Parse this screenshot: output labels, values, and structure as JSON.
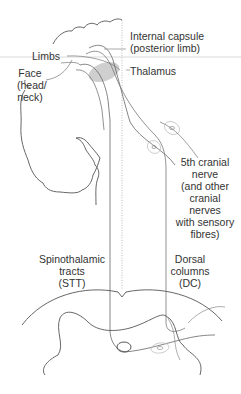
{
  "labels": {
    "internal_capsule": {
      "line1": "Internal capsule",
      "line2": "(posterior limb)"
    },
    "thalamus": "Thalamus",
    "limbs": "Limbs",
    "face": {
      "line1": "Face",
      "line2": "(head/",
      "line3": "neck)"
    },
    "cranial_nerve": {
      "line1": "5th cranial",
      "line2": "nerve",
      "line3": "(and other",
      "line4": "cranial",
      "line5": "nerves",
      "line6": "with sensory",
      "line7": "fibres)"
    },
    "stt": {
      "line1": "Spinothalamic",
      "line2": "tracts",
      "line3": "(STT)"
    },
    "dc": {
      "line1": "Dorsal",
      "line2": "columns",
      "line3": "(DC)"
    }
  },
  "colors": {
    "line": "#555555",
    "light_line": "#999999",
    "thalamus_fill": "#cfcfcf",
    "ganglion": "#bbbbbb"
  }
}
